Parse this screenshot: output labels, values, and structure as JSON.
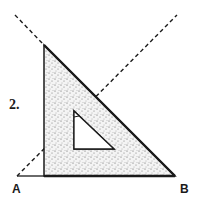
{
  "figure": {
    "step_label": "2.",
    "point_a_label": "A",
    "point_b_label": "B",
    "colors": {
      "ink": "#1a1a1a",
      "fill": "#d9d9d9",
      "background": "#ffffff"
    },
    "set_square": {
      "right_angle_vertex": [
        44,
        176
      ],
      "top_vertex": [
        44,
        45
      ],
      "bottom_right_vertex": [
        175,
        176
      ],
      "inner_hole": [
        [
          74,
          111
        ],
        [
          74,
          149
        ],
        [
          114,
          149
        ]
      ]
    },
    "dashed_lines": [
      {
        "from": [
          15,
          15
        ],
        "to": [
          175,
          176
        ]
      },
      {
        "from": [
          17,
          176
        ],
        "to": [
          177,
          15
        ]
      }
    ],
    "baseline": {
      "from": [
        17,
        176
      ],
      "to": [
        175,
        176
      ]
    }
  }
}
